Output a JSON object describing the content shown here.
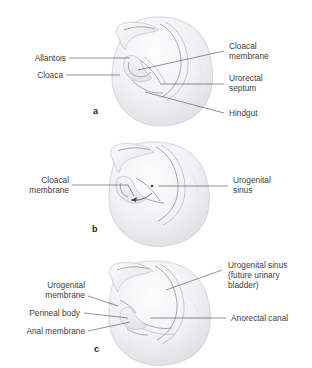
{
  "figure": {
    "background_color": "#ffffff",
    "text_color": "#3d3d3d",
    "leader_color": "#4a4a4a",
    "tissue_fill": "#ededf0",
    "duct_color": "#9a9aa2"
  },
  "panels": [
    {
      "letter": "a",
      "labels_left": [
        {
          "text": "Allantois"
        },
        {
          "text": "Cloaca"
        }
      ],
      "labels_right": [
        {
          "line1": "Cloacal",
          "line2": "membrane"
        },
        {
          "line1": "Urorectal",
          "line2": "septum"
        },
        {
          "line1": "Hindgut",
          "line2": ""
        }
      ]
    },
    {
      "letter": "b",
      "labels_left": [
        {
          "line1": "Cloacal",
          "line2": "membrane"
        }
      ],
      "labels_right": [
        {
          "line1": "Urogenital",
          "line2": "sinus"
        }
      ]
    },
    {
      "letter": "c",
      "labels_left": [
        {
          "line1": "Urogenital",
          "line2": "membrane"
        },
        {
          "line1": "Perineal body",
          "line2": ""
        },
        {
          "line1": "Anal membrane",
          "line2": ""
        }
      ],
      "labels_right": [
        {
          "line1": "Urogenital sinus",
          "line2": "(future urinary",
          "line3": "bladder)"
        },
        {
          "line1": "Anorectal canal",
          "line2": ""
        }
      ]
    }
  ]
}
